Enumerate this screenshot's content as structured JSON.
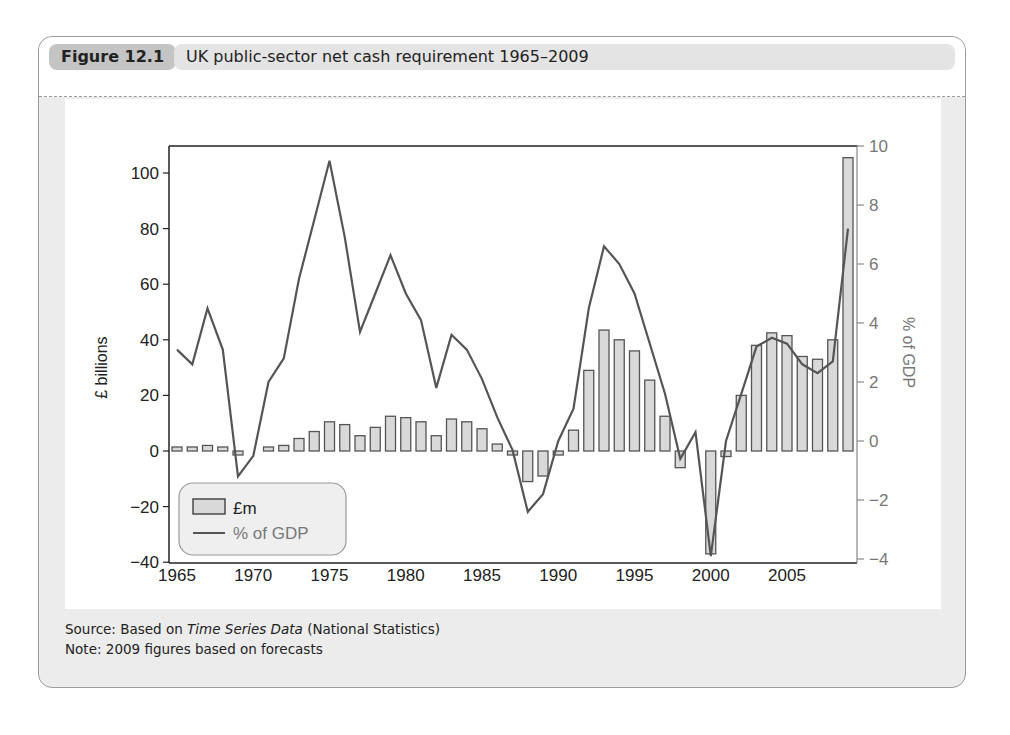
{
  "figure": {
    "label": "Figure 12.1",
    "title": "UK public-sector net cash requirement 1965–2009"
  },
  "footer": {
    "source_prefix": "Source: Based on ",
    "source_italic": "Time Series Data",
    "source_suffix": " (National Statistics)",
    "note": "Note: 2009 figures based on forecasts"
  },
  "colors": {
    "bar_fill": "#d9d9d9",
    "bar_stroke": "#555555",
    "line": "#555555",
    "panel_bg": "#ececec",
    "fig_label_bg": "#c4c4c4",
    "fig_title_bg": "#e4e4e4"
  },
  "chart_data": {
    "type": "bar+line",
    "title": "UK public-sector net cash requirement 1965–2009",
    "xlabel": "",
    "ylabel": "£ billions",
    "ylabel_right": "% of GDP",
    "ylim": [
      -40,
      110
    ],
    "ylim_right": [
      -4,
      10
    ],
    "yticks": [
      -40,
      -20,
      0,
      20,
      40,
      60,
      80,
      100
    ],
    "yticks_right": [
      -4,
      -2,
      0,
      2,
      4,
      6,
      8,
      10
    ],
    "xticks": [
      1965,
      1970,
      1975,
      1980,
      1985,
      1990,
      1995,
      2000,
      2005
    ],
    "grid": false,
    "legend_position": "lower left",
    "x": [
      1965,
      1966,
      1967,
      1968,
      1969,
      1970,
      1971,
      1972,
      1973,
      1974,
      1975,
      1976,
      1977,
      1978,
      1979,
      1980,
      1981,
      1982,
      1983,
      1984,
      1985,
      1986,
      1987,
      1988,
      1989,
      1990,
      1991,
      1992,
      1993,
      1994,
      1995,
      1996,
      1997,
      1998,
      1999,
      2000,
      2001,
      2002,
      2003,
      2004,
      2005,
      2006,
      2007,
      2008,
      2009
    ],
    "series": [
      {
        "name": "£m",
        "type": "bar",
        "axis": "left",
        "values": [
          1,
          1,
          2,
          1,
          -1,
          0,
          1,
          2,
          4.5,
          7,
          10.5,
          9.5,
          5.5,
          8.5,
          12.5,
          12,
          10.5,
          5.5,
          11.5,
          10.5,
          8,
          2.5,
          -1,
          -11,
          -9,
          -1,
          7.5,
          29,
          43.5,
          40,
          36,
          25.5,
          12.5,
          -6,
          0,
          -37,
          -2,
          20,
          38,
          42.5,
          41.5,
          34,
          33,
          40,
          105.5
        ]
      },
      {
        "name": "% of GDP",
        "type": "line",
        "axis": "right",
        "values": [
          3.1,
          2.6,
          4.5,
          3.1,
          -1.2,
          -0.5,
          2.0,
          2.8,
          5.5,
          7.5,
          9.5,
          6.9,
          3.7,
          5.0,
          6.3,
          5.0,
          4.1,
          1.8,
          3.6,
          3.1,
          2.1,
          0.8,
          -0.3,
          -2.4,
          -1.8,
          0.0,
          1.1,
          4.5,
          6.6,
          6.0,
          5.0,
          3.3,
          1.6,
          -0.6,
          0.3,
          -3.9,
          0.0,
          1.6,
          3.2,
          3.5,
          3.3,
          2.6,
          2.3,
          2.7,
          7.2
        ]
      }
    ]
  }
}
